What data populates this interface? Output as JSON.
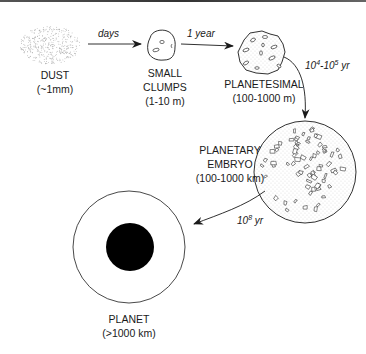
{
  "diagram": {
    "stages": [
      {
        "id": "dust",
        "name": "DUST",
        "size": "(~1mm)"
      },
      {
        "id": "small-clumps",
        "name_line1": "SMALL",
        "name_line2": "CLUMPS",
        "size": "(1-10 m)"
      },
      {
        "id": "planetesimal",
        "name": "PLANETESIMAL",
        "size": "(100-1000 m)"
      },
      {
        "id": "planetary-embryo",
        "name_line1": "PLANETARY",
        "name_line2": "EMBRYO",
        "size": "(100-1000 km)"
      },
      {
        "id": "planet",
        "name": "PLANET",
        "size": "(>1000 km)"
      }
    ],
    "transitions": [
      {
        "from": "dust",
        "to": "small-clumps",
        "time": "days"
      },
      {
        "from": "small-clumps",
        "to": "planetesimal",
        "time": "1 year"
      },
      {
        "from": "planetesimal",
        "to": "planetary-embryo",
        "time_base1": "10",
        "time_exp1": "4",
        "time_sep": "-",
        "time_base2": "10",
        "time_exp2": "5",
        "time_unit": " yr"
      },
      {
        "from": "planetary-embryo",
        "to": "planet",
        "time_base": "10",
        "time_exp": "8",
        "time_unit": " yr"
      }
    ]
  },
  "colors": {
    "ink": "#1a1a1a",
    "dust": "#9a9a9a",
    "planet_core": "#000000",
    "background": "#ffffff"
  }
}
